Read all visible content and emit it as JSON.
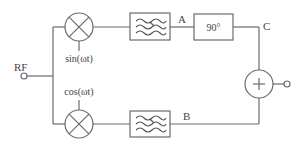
{
  "diagram": {
    "type": "block-diagram",
    "colors": {
      "line": "#6b6b6b",
      "text": "#444444",
      "background": "#ffffff"
    },
    "input": {
      "label": "RF",
      "terminal": "input-port"
    },
    "mixers": [
      {
        "id": "mixer-top",
        "symbol": "multiply",
        "lo_label": "sin(ωt)"
      },
      {
        "id": "mixer-bottom",
        "symbol": "multiply",
        "lo_label": "cos(ωt)"
      }
    ],
    "filters": [
      {
        "id": "filter-top",
        "symbol": "filter-waves"
      },
      {
        "id": "filter-bottom",
        "symbol": "filter-waves"
      }
    ],
    "nodes": {
      "a": "A",
      "b": "B",
      "c": "C"
    },
    "phase_shifter": {
      "label": "90°"
    },
    "summer": {
      "symbol": "+"
    },
    "output": {
      "terminal": "output-port"
    }
  }
}
